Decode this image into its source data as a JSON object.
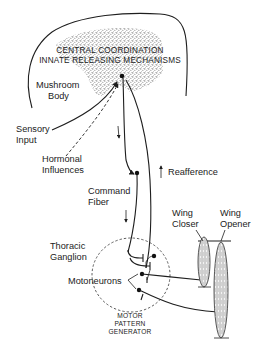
{
  "diagram": {
    "type": "neural control schematic",
    "labels": {
      "central_line1": "CENTRAL COORDINATION",
      "central_line2": "INNATE RELEASING MECHANISMS",
      "mushroom_line1": "Mushroom",
      "mushroom_line2": "Body",
      "sensory_line1": "Sensory",
      "sensory_line2": "Input",
      "hormonal_line1": "Hormonal",
      "hormonal_line2": "Influences",
      "reafference": "Reafference",
      "command_line1": "Command",
      "command_line2": "Fiber",
      "thoracic_line1": "Thoracic",
      "thoracic_line2": "Ganglion",
      "motoneurons": "Motoneurons",
      "mpg_line1": "MOTOR",
      "mpg_line2": "PATTERN",
      "mpg_line3": "GENERATOR",
      "wing_closer_line1": "Wing",
      "wing_closer_line2": "Closer",
      "wing_opener_line1": "Wing",
      "wing_opener_line2": "Opener"
    },
    "colors": {
      "ink": "#1e1e1e",
      "stipple": "#555555",
      "background": "#ffffff"
    }
  }
}
